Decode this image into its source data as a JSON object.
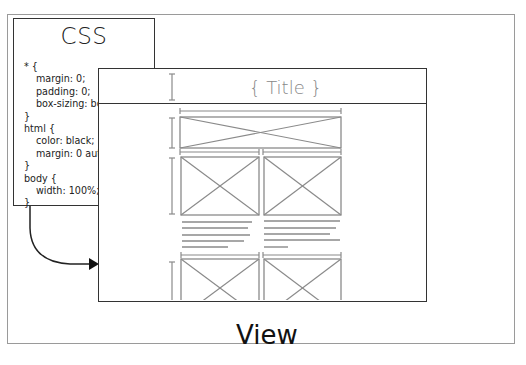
{
  "diagram": {
    "css_panel": {
      "title": "CSS",
      "code_lines": [
        {
          "text": "* {",
          "indent": 0
        },
        {
          "text": "margin: 0;",
          "indent": 1
        },
        {
          "text": "padding: 0;",
          "indent": 1
        },
        {
          "text": "box-sizing: bor",
          "indent": 1
        },
        {
          "text": "}",
          "indent": 0
        },
        {
          "text": "html {",
          "indent": 0
        },
        {
          "text": "color: black;",
          "indent": 1
        },
        {
          "text": "margin: 0 auto",
          "indent": 1
        },
        {
          "text": "}",
          "indent": 0
        },
        {
          "text": "body {",
          "indent": 0
        },
        {
          "text": "width: 100%;",
          "indent": 1
        },
        {
          "text": "}",
          "indent": 0
        }
      ]
    },
    "view_window": {
      "title": "{ Title }",
      "wireframe": {
        "banner_placeholders": 1,
        "image_rows": [
          {
            "columns": 2,
            "followed_by_text_lines": [
              5,
              5
            ]
          },
          {
            "columns": 2,
            "cut_off": true
          }
        ]
      }
    },
    "arrow": {
      "from": "css_panel",
      "to": "view_window"
    },
    "view_label": "View",
    "colors": {
      "stroke_dark": "#333333",
      "stroke_wire": "#8a8a8a",
      "frame": "#9a9a9a",
      "title_gray": "#888888"
    }
  }
}
